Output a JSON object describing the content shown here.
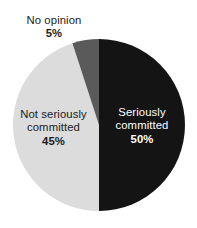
{
  "chart_data": {
    "type": "pie",
    "title": "",
    "subtitle": "",
    "xlabel": "",
    "ylabel": "",
    "legend_position": "none",
    "grid": false,
    "labels_inside": true,
    "start_angle_deg": 0,
    "direction": "clockwise",
    "categories": [
      "Seriously committed",
      "Not seriously committed",
      "No opinion"
    ],
    "values": [
      50,
      45,
      5
    ],
    "units": "%",
    "slices": [
      {
        "name": "Seriously committed",
        "value": 50,
        "value_label": "50%",
        "color": "#141414",
        "text_color": "#ffffff",
        "label_line_1": "Seriously",
        "label_line_2": "committed",
        "label_placement": "inside"
      },
      {
        "name": "Not seriously committed",
        "value": 45,
        "value_label": "45%",
        "color": "#dcdcdc",
        "text_color": "#1b1b1b",
        "label_line_1": "Not seriously",
        "label_line_2": "committed",
        "label_placement": "inside"
      },
      {
        "name": "No opinion",
        "value": 5,
        "value_label": "5%",
        "color": "#5a5a5a",
        "text_color": "#1b1b1b",
        "label_line_1": "No opinion",
        "label_line_2": "",
        "label_placement": "outside-top-left"
      }
    ],
    "background_color": "#ffffff"
  }
}
